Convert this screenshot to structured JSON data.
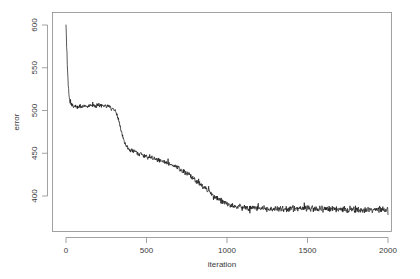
{
  "figure": {
    "background_color": "#ffffff",
    "axis_color": "#8a8a8a",
    "line_color": "#111111"
  },
  "chart_data": {
    "type": "line",
    "title": "",
    "subtitle": "",
    "xlabel": "iteration",
    "ylabel": "error",
    "xlim": [
      -40,
      2040
    ],
    "ylim": [
      380,
      608
    ],
    "xticks": [
      0,
      500,
      1000,
      1500,
      2000
    ],
    "yticks": [
      400,
      450,
      500,
      550,
      600
    ],
    "xtick_labels": [
      "0",
      "500",
      "1000",
      "1500",
      "2000"
    ],
    "ytick_labels": [
      "400",
      "450",
      "500",
      "550",
      "600"
    ],
    "grid": false,
    "legend": false,
    "legend_position": "none",
    "box": true,
    "series": [
      {
        "name": "error",
        "color": "#111111",
        "noise_amplitude_by_phase": {
          "initial_drop": 0.8,
          "first_plateau": 3.0,
          "transition": 2.6,
          "slow_decline": 3.4,
          "final_plateau": 4.6
        },
        "description": "Training error per iteration: sharp initial drop from ~600 to ~507, noisy plateau near 505 until iteration ~300, sigmoid drop to ~455 by iteration ~420, gradual noisy decline to ~390 by iteration ~1050, then flat noisy plateau near 385 through iteration 2000.",
        "control_points": [
          {
            "x": 0,
            "y": 600
          },
          {
            "x": 5,
            "y": 571
          },
          {
            "x": 10,
            "y": 545
          },
          {
            "x": 15,
            "y": 527
          },
          {
            "x": 20,
            "y": 515
          },
          {
            "x": 25,
            "y": 509
          },
          {
            "x": 35,
            "y": 506
          },
          {
            "x": 50,
            "y": 505
          },
          {
            "x": 75,
            "y": 505
          },
          {
            "x": 100,
            "y": 505
          },
          {
            "x": 130,
            "y": 505
          },
          {
            "x": 160,
            "y": 506
          },
          {
            "x": 190,
            "y": 506
          },
          {
            "x": 220,
            "y": 506
          },
          {
            "x": 250,
            "y": 505
          },
          {
            "x": 270,
            "y": 504
          },
          {
            "x": 290,
            "y": 502
          },
          {
            "x": 305,
            "y": 499
          },
          {
            "x": 315,
            "y": 495
          },
          {
            "x": 325,
            "y": 489
          },
          {
            "x": 335,
            "y": 482
          },
          {
            "x": 345,
            "y": 475
          },
          {
            "x": 355,
            "y": 468
          },
          {
            "x": 365,
            "y": 462
          },
          {
            "x": 375,
            "y": 458
          },
          {
            "x": 390,
            "y": 455
          },
          {
            "x": 405,
            "y": 453
          },
          {
            "x": 425,
            "y": 452
          },
          {
            "x": 450,
            "y": 450
          },
          {
            "x": 480,
            "y": 448
          },
          {
            "x": 510,
            "y": 446
          },
          {
            "x": 545,
            "y": 444
          },
          {
            "x": 580,
            "y": 442
          },
          {
            "x": 615,
            "y": 440
          },
          {
            "x": 650,
            "y": 437
          },
          {
            "x": 685,
            "y": 434
          },
          {
            "x": 720,
            "y": 430
          },
          {
            "x": 755,
            "y": 426
          },
          {
            "x": 790,
            "y": 421
          },
          {
            "x": 825,
            "y": 415
          },
          {
            "x": 860,
            "y": 410
          },
          {
            "x": 890,
            "y": 405
          },
          {
            "x": 920,
            "y": 400
          },
          {
            "x": 950,
            "y": 396
          },
          {
            "x": 980,
            "y": 393
          },
          {
            "x": 1010,
            "y": 390
          },
          {
            "x": 1045,
            "y": 388
          },
          {
            "x": 1080,
            "y": 387
          },
          {
            "x": 1120,
            "y": 386
          },
          {
            "x": 1180,
            "y": 386
          },
          {
            "x": 1250,
            "y": 385
          },
          {
            "x": 1330,
            "y": 385
          },
          {
            "x": 1420,
            "y": 385
          },
          {
            "x": 1520,
            "y": 385
          },
          {
            "x": 1620,
            "y": 385
          },
          {
            "x": 1720,
            "y": 384
          },
          {
            "x": 1820,
            "y": 384
          },
          {
            "x": 1920,
            "y": 384
          },
          {
            "x": 2000,
            "y": 384
          }
        ]
      }
    ]
  }
}
